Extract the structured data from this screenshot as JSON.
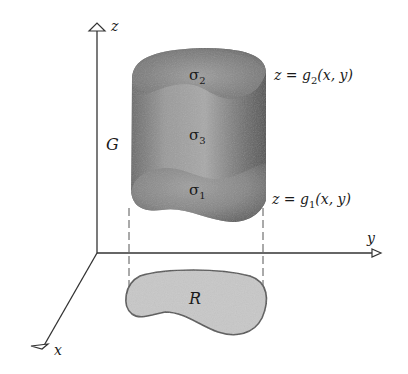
{
  "figure": {
    "axes": {
      "z_label": "z",
      "y_label": "y",
      "x_label": "x"
    },
    "solid": {
      "label": "G",
      "surfaces": {
        "top": {
          "symbol": "σ",
          "subscript": "2"
        },
        "side": {
          "symbol": "σ",
          "subscript": "3"
        },
        "bottom": {
          "symbol": "σ",
          "subscript": "1"
        }
      }
    },
    "equations": {
      "upper": {
        "lhs": "z = ",
        "func": "g",
        "sub": "2",
        "args": "(x, y)"
      },
      "lower": {
        "lhs": "z = ",
        "func": "g",
        "sub": "1",
        "args": "(x, y)"
      }
    },
    "region": {
      "label": "R"
    },
    "colors": {
      "axis": "#333333",
      "solid_dark": "#4a4a4a",
      "solid_mid": "#8a8a8a",
      "solid_light": "#b5b5b5",
      "region_fill": "#c8c8c8",
      "region_stroke": "#555555"
    }
  }
}
